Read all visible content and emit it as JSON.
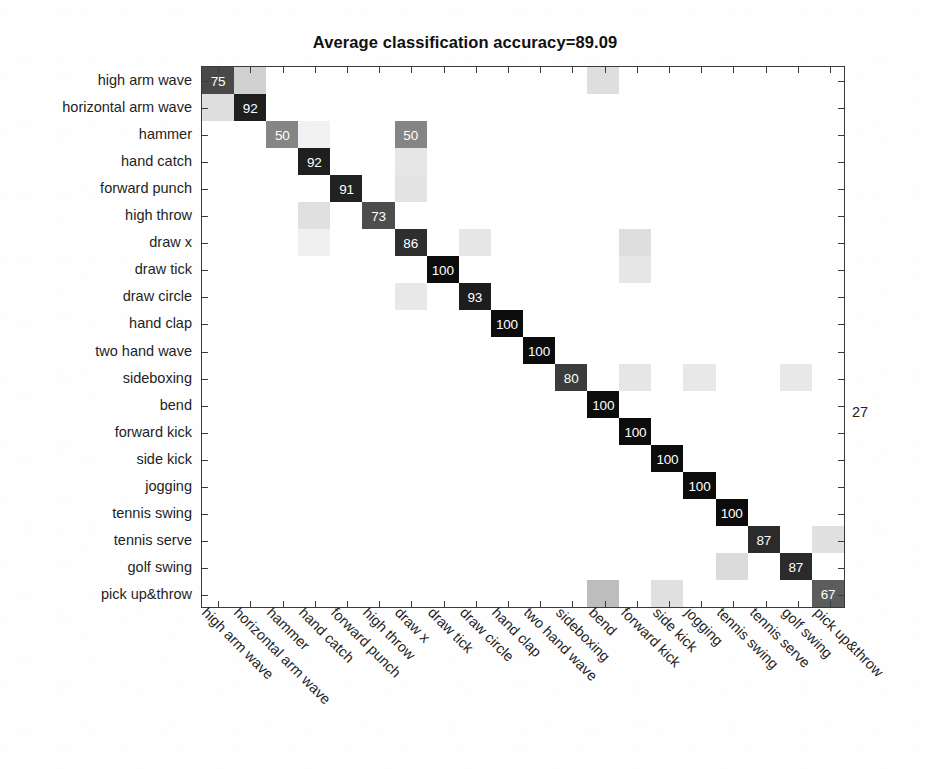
{
  "figure": {
    "title": "Average classification accuracy=89.09",
    "background_color": "#ffffff",
    "axis_color": "#3b3b3b",
    "text_color": "#1f1f1f",
    "stray_annotation": "27"
  },
  "chart_data": {
    "type": "heatmap",
    "title": "Average classification accuracy=89.09",
    "subtitle": "",
    "xlabel": "",
    "ylabel": "",
    "average_accuracy": 89.09,
    "units": "percent",
    "value_range": [
      0,
      100
    ],
    "grid": false,
    "legend": "none",
    "colormap": "grayscale-inverted",
    "colormap_note": "high value = black cell with white text; low value = light gray cell; zero = white",
    "categories": [
      "high arm wave",
      "horizontal arm wave",
      "hammer",
      "hand catch",
      "forward punch",
      "high throw",
      "draw x",
      "draw tick",
      "draw circle",
      "hand clap",
      "two hand wave",
      "sideboxing",
      "bend",
      "forward kick",
      "side kick",
      "jogging",
      "tennis swing",
      "tennis serve",
      "golf swing",
      "pick up&throw"
    ],
    "x_categories": [
      "high arm wave",
      "horizontal arm wave",
      "hammer",
      "hand catch",
      "forward punch",
      "high throw",
      "draw x",
      "draw tick",
      "draw circle",
      "hand clap",
      "two hand wave",
      "sideboxing",
      "bend",
      "forward kick",
      "side kick",
      "jogging",
      "tennis swing",
      "tennis serve",
      "golf swing",
      "pick up&throw"
    ],
    "y_categories": [
      "high arm wave",
      "horizontal arm wave",
      "hammer",
      "hand catch",
      "forward punch",
      "high throw",
      "draw x",
      "draw tick",
      "draw circle",
      "hand clap",
      "two hand wave",
      "sideboxing",
      "bend",
      "forward kick",
      "side kick",
      "jogging",
      "tennis swing",
      "tennis serve",
      "golf swing",
      "pick up&throw"
    ],
    "diagonal_values": [
      75,
      92,
      50,
      92,
      91,
      73,
      86,
      100,
      93,
      100,
      100,
      80,
      100,
      100,
      100,
      100,
      100,
      87,
      87,
      67
    ],
    "labeled_cells": [
      {
        "row": 0,
        "col": 0,
        "value": 75
      },
      {
        "row": 1,
        "col": 1,
        "value": 92
      },
      {
        "row": 2,
        "col": 2,
        "value": 50
      },
      {
        "row": 2,
        "col": 6,
        "value": 50
      },
      {
        "row": 3,
        "col": 3,
        "value": 92
      },
      {
        "row": 4,
        "col": 4,
        "value": 91
      },
      {
        "row": 5,
        "col": 5,
        "value": 73
      },
      {
        "row": 6,
        "col": 6,
        "value": 86
      },
      {
        "row": 7,
        "col": 7,
        "value": 100
      },
      {
        "row": 8,
        "col": 8,
        "value": 93
      },
      {
        "row": 9,
        "col": 9,
        "value": 100
      },
      {
        "row": 10,
        "col": 10,
        "value": 100
      },
      {
        "row": 11,
        "col": 11,
        "value": 80
      },
      {
        "row": 12,
        "col": 12,
        "value": 100
      },
      {
        "row": 13,
        "col": 13,
        "value": 100
      },
      {
        "row": 14,
        "col": 14,
        "value": 100
      },
      {
        "row": 15,
        "col": 15,
        "value": 100
      },
      {
        "row": 16,
        "col": 16,
        "value": 100
      },
      {
        "row": 17,
        "col": 17,
        "value": 87
      },
      {
        "row": 18,
        "col": 18,
        "value": 87
      },
      {
        "row": 19,
        "col": 19,
        "value": 67
      }
    ],
    "faint_cells": [
      {
        "row": 0,
        "col": 1,
        "shade": 0.18
      },
      {
        "row": 0,
        "col": 12,
        "shade": 0.13
      },
      {
        "row": 1,
        "col": 0,
        "shade": 0.13
      },
      {
        "row": 2,
        "col": 3,
        "shade": 0.05
      },
      {
        "row": 3,
        "col": 6,
        "shade": 0.1
      },
      {
        "row": 4,
        "col": 6,
        "shade": 0.11
      },
      {
        "row": 5,
        "col": 3,
        "shade": 0.12
      },
      {
        "row": 6,
        "col": 3,
        "shade": 0.06
      },
      {
        "row": 6,
        "col": 8,
        "shade": 0.1
      },
      {
        "row": 6,
        "col": 13,
        "shade": 0.13
      },
      {
        "row": 7,
        "col": 13,
        "shade": 0.1
      },
      {
        "row": 8,
        "col": 6,
        "shade": 0.09
      },
      {
        "row": 11,
        "col": 13,
        "shade": 0.1
      },
      {
        "row": 11,
        "col": 15,
        "shade": 0.09
      },
      {
        "row": 11,
        "col": 18,
        "shade": 0.09
      },
      {
        "row": 17,
        "col": 19,
        "shade": 0.12
      },
      {
        "row": 18,
        "col": 16,
        "shade": 0.14
      },
      {
        "row": 19,
        "col": 12,
        "shade": 0.26
      },
      {
        "row": 19,
        "col": 14,
        "shade": 0.12
      }
    ]
  }
}
